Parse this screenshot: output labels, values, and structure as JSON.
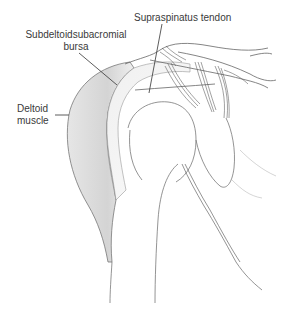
{
  "diagram": {
    "labels": [
      {
        "id": "supraspinatus",
        "text": "Supraspinatus tendon"
      },
      {
        "id": "bursa",
        "line1": "Subdeltoidsubacromial",
        "line2": "bursa"
      },
      {
        "id": "deltoid",
        "line1": "Deltoid",
        "line2": "muscle"
      }
    ],
    "colors": {
      "line": "#555555",
      "text": "#3a3a3a",
      "muscle_shade": "#d9d9d9",
      "background": "#ffffff"
    }
  }
}
